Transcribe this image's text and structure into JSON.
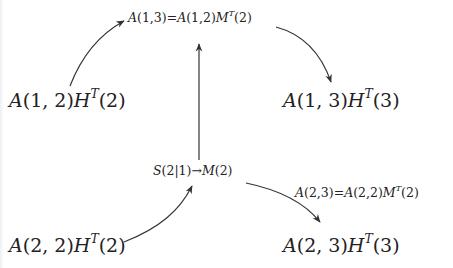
{
  "diagram": {
    "nodes": [
      {
        "id": "top",
        "parts": {
          "a": "A",
          "args": "(1,3)=",
          "b": "A",
          "bargs": "(1,2)",
          "m": "M",
          "sup": "T",
          "tail": "(2)"
        }
      },
      {
        "id": "a12",
        "parts": {
          "a": "A",
          "args": "(1, 2)",
          "h": "H",
          "sup": "T",
          "tail": "(2)"
        }
      },
      {
        "id": "a13",
        "parts": {
          "a": "A",
          "args": "(1, 3)",
          "h": "H",
          "sup": "T",
          "tail": "(3)"
        }
      },
      {
        "id": "mid",
        "parts": {
          "s": "S",
          "args": "(2|1)",
          "arrow": "→",
          "m": "M",
          "tail": "(2)"
        }
      },
      {
        "id": "side",
        "parts": {
          "a": "A",
          "args": "(2,3)=",
          "b": "A",
          "bargs": "(2,2)",
          "m": "M",
          "sup": "T",
          "tail": "(2)"
        }
      },
      {
        "id": "a22",
        "parts": {
          "a": "A",
          "args": "(2, 2)",
          "h": "H",
          "sup": "T",
          "tail": "(2)"
        }
      },
      {
        "id": "a23",
        "parts": {
          "a": "A",
          "args": "(2, 3)",
          "h": "H",
          "sup": "T",
          "tail": "(3)"
        }
      }
    ],
    "edges": [
      {
        "from": "A(1,2)H^T(2)",
        "to": "A(1,3)=A(1,2)M^T(2)",
        "style": "curved"
      },
      {
        "from": "A(1,3)=A(1,2)M^T(2)",
        "to": "A(1,3)H^T(3)",
        "style": "curved"
      },
      {
        "from": "S(2|1)→M(2)",
        "to": "A(1,3)=A(1,2)M^T(2)",
        "style": "straight"
      },
      {
        "from": "A(2,2)H^T(2)",
        "to": "S(2|1)→M(2)",
        "style": "curved"
      },
      {
        "from": "S(2|1)→M(2)",
        "to": "A(2,3)H^T(3)",
        "style": "curved"
      }
    ],
    "colors": {
      "stroke": "#333333",
      "text": "#222222",
      "background": "#ffffff"
    }
  }
}
